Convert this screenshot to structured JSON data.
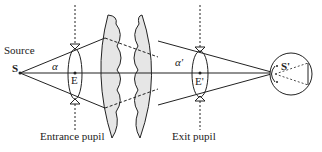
{
  "diagram": {
    "type": "optical-system-pupils",
    "labels": {
      "source": "Source",
      "source_point": "S",
      "image_point": "S'",
      "entrance_center": "E",
      "exit_center": "E'",
      "alpha": "α",
      "alpha_prime": "α'",
      "entrance_pupil": "Entrance pupil",
      "exit_pupil": "Exit pupil"
    },
    "colors": {
      "line": "#222222",
      "lens_fill": "#e6e6e6"
    }
  }
}
